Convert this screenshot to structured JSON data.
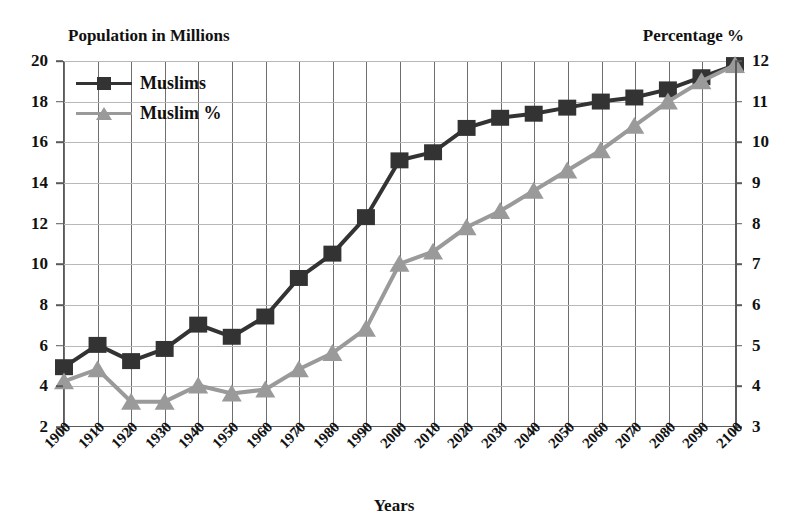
{
  "chart_data": {
    "type": "line",
    "title": "",
    "xlabel": "Years",
    "ylabel_left": "Population in Millions",
    "ylabel_right": "Percentage %",
    "grid": true,
    "legend_position": "top-left",
    "x": [
      1900,
      1910,
      1920,
      1930,
      1940,
      1950,
      1960,
      1970,
      1980,
      1990,
      2000,
      2010,
      2020,
      2030,
      2040,
      2050,
      2060,
      2070,
      2080,
      2090,
      2100
    ],
    "xtick_labels": [
      "1900",
      "1910",
      "1920",
      "1930",
      "1940",
      "1950",
      "1960",
      "1970",
      "1980",
      "1990",
      "2000",
      "2010",
      "2020",
      "2030",
      "2040",
      "2050",
      "2060",
      "2070",
      "2080",
      "2090",
      "2100"
    ],
    "left_axis": {
      "ylim": [
        2,
        20
      ],
      "ticks": [
        2,
        4,
        6,
        8,
        10,
        12,
        14,
        16,
        18,
        20
      ],
      "tick_labels": [
        "2",
        "4",
        "6",
        "8",
        "10",
        "12",
        "14",
        "16",
        "18",
        "20"
      ]
    },
    "right_axis": {
      "ylim": [
        3,
        12
      ],
      "ticks": [
        3,
        4,
        5,
        6,
        7,
        8,
        9,
        10,
        11,
        12
      ],
      "tick_labels": [
        "3",
        "4",
        "5",
        "6",
        "7",
        "8",
        "9",
        "10",
        "11",
        "12"
      ]
    },
    "series": [
      {
        "name": "Muslims",
        "axis": "left",
        "marker": "square",
        "color": "#333333",
        "values": [
          4.9,
          6.0,
          5.2,
          5.8,
          7.0,
          6.4,
          7.4,
          9.3,
          10.5,
          12.3,
          15.1,
          15.5,
          16.7,
          17.2,
          17.4,
          17.7,
          18.0,
          18.2,
          18.6,
          19.2,
          19.8
        ]
      },
      {
        "name": "Muslim %",
        "axis": "right",
        "marker": "triangle",
        "color": "#9a9a9a",
        "values": [
          4.1,
          4.4,
          3.6,
          3.6,
          4.0,
          3.8,
          3.9,
          4.4,
          4.8,
          5.4,
          7.0,
          7.3,
          7.9,
          8.3,
          8.8,
          9.3,
          9.8,
          10.4,
          11.0,
          11.5,
          11.9
        ]
      }
    ]
  },
  "legend": {
    "items": [
      {
        "label": "Muslims"
      },
      {
        "label": "Muslim %"
      }
    ]
  },
  "colors": {
    "series_muslims": "#333333",
    "series_percent": "#9a9a9a",
    "grid_vertical": "#6e6e6e",
    "grid_horizontal": "#b8b8b8",
    "axis": "#5a5a5a",
    "text": "#111111"
  }
}
